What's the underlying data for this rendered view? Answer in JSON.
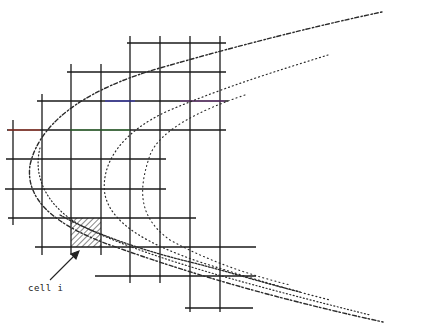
{
  "figure": {
    "label": {
      "text": "cell i",
      "x": 28,
      "y": 286
    },
    "arrow": {
      "from": [
        50,
        280
      ],
      "to": [
        78,
        252
      ]
    },
    "hatched_cell": {
      "x": 71,
      "y": 218,
      "w": 30,
      "h": 29
    },
    "colors": {
      "grid": "#1a1a1a",
      "curve": "#2a2a2a",
      "background": "#ffffff",
      "accent_red": "#c0392b",
      "accent_blue": "#3b3bd6",
      "accent_green": "#3a9a3a"
    }
  }
}
